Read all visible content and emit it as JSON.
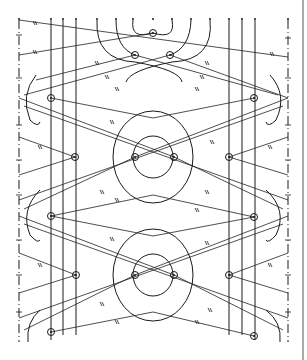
{
  "diagram": {
    "title": "",
    "type": "bobbin-lace-pricking",
    "ink_color": "#1a1a1a",
    "background": "#ffffff",
    "edge_lines_x": [
      19,
      288
    ],
    "right_border_x": 303,
    "vertical_passives_x": [
      51,
      63,
      76,
      229,
      242,
      255
    ],
    "top_pin_row_y": 20,
    "top_pins_x": [
      19,
      51,
      63,
      76,
      97,
      116,
      133,
      153,
      172,
      191,
      210,
      229,
      242,
      255,
      288
    ],
    "pinholes": [
      {
        "x": 153,
        "y": 33
      },
      {
        "x": 135,
        "y": 55
      },
      {
        "x": 170,
        "y": 55
      },
      {
        "x": 51,
        "y": 98
      },
      {
        "x": 254,
        "y": 98
      },
      {
        "x": 75,
        "y": 157
      },
      {
        "x": 135,
        "y": 157
      },
      {
        "x": 174,
        "y": 157
      },
      {
        "x": 229,
        "y": 157
      },
      {
        "x": 51,
        "y": 216
      },
      {
        "x": 254,
        "y": 217
      },
      {
        "x": 76,
        "y": 275
      },
      {
        "x": 135,
        "y": 275
      },
      {
        "x": 174,
        "y": 275
      },
      {
        "x": 229,
        "y": 275
      },
      {
        "x": 51,
        "y": 332
      },
      {
        "x": 254,
        "y": 336
      }
    ],
    "ring_motifs": [
      {
        "cx": 153,
        "cy": 157,
        "outer_rx": 40,
        "outer_ry": 46,
        "inner_rx": 20,
        "inner_ry": 21
      },
      {
        "cx": 153,
        "cy": 275,
        "outer_rx": 40,
        "outer_ry": 46,
        "inner_rx": 20,
        "inner_ry": 21
      }
    ]
  }
}
